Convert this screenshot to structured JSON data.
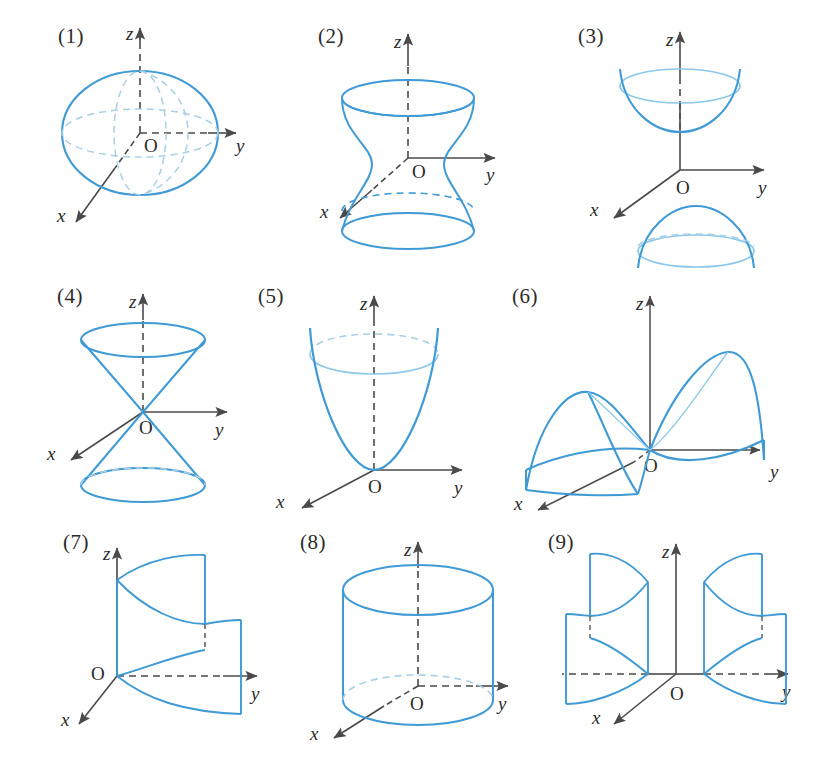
{
  "plate": {
    "title": "Nine quadric surfaces",
    "background_color": "#ffffff",
    "width": 819,
    "height": 779
  },
  "style": {
    "curve_color": "#3f9ad6",
    "curve_color_light": "#8cc8e8",
    "hidden_curve_color": "#a9cfe4",
    "axis_color": "#4a4a4a",
    "axis_hidden_color": "#555555",
    "label_color": "#2b2b2b"
  },
  "axis_labels": {
    "x": "x",
    "y": "y",
    "z": "z",
    "origin": "O"
  },
  "figures": [
    {
      "number": "(1)",
      "name": "ellipsoid",
      "label": "(1)",
      "row": 1,
      "col": 1,
      "has_origin_label": true,
      "axes": [
        "x",
        "y",
        "z"
      ]
    },
    {
      "number": "(2)",
      "name": "hyperboloid-of-one-sheet",
      "label": "(2)",
      "row": 1,
      "col": 2,
      "has_origin_label": true,
      "axes": [
        "x",
        "y",
        "z"
      ]
    },
    {
      "number": "(3)",
      "name": "hyperboloid-of-two-sheets",
      "label": "(3)",
      "row": 1,
      "col": 3,
      "has_origin_label": true,
      "axes": [
        "x",
        "y",
        "z"
      ]
    },
    {
      "number": "(4)",
      "name": "elliptic-cone",
      "label": "(4)",
      "row": 2,
      "col": 1,
      "has_origin_label": true,
      "axes": [
        "x",
        "y",
        "z"
      ]
    },
    {
      "number": "(5)",
      "name": "elliptic-paraboloid",
      "label": "(5)",
      "row": 2,
      "col": 2,
      "has_origin_label": true,
      "axes": [
        "x",
        "y",
        "z"
      ]
    },
    {
      "number": "(6)",
      "name": "hyperbolic-paraboloid-saddle",
      "label": "(6)",
      "row": 2,
      "col": 3,
      "has_origin_label": true,
      "axes": [
        "x",
        "y",
        "z"
      ]
    },
    {
      "number": "(7)",
      "name": "parabolic-cylinder",
      "label": "(7)",
      "row": 3,
      "col": 1,
      "has_origin_label": true,
      "axes": [
        "x",
        "y",
        "z"
      ]
    },
    {
      "number": "(8)",
      "name": "elliptic-cylinder",
      "label": "(8)",
      "row": 3,
      "col": 2,
      "has_origin_label": true,
      "axes": [
        "x",
        "y",
        "z"
      ]
    },
    {
      "number": "(9)",
      "name": "hyperbolic-cylinder",
      "label": "(9)",
      "row": 3,
      "col": 3,
      "has_origin_label": true,
      "axes": [
        "x",
        "y",
        "z"
      ]
    }
  ]
}
